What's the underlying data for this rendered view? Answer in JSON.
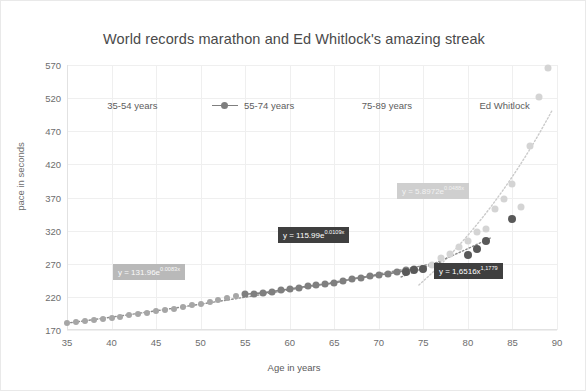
{
  "chart_data": {
    "type": "scatter",
    "title": "World records marathon and Ed Whitlock's amazing streak",
    "xlabel": "Age in years",
    "ylabel": "pace in seconds",
    "xlim": [
      35,
      90
    ],
    "ylim": [
      170,
      570
    ],
    "xticks": [
      35,
      40,
      45,
      50,
      55,
      60,
      65,
      70,
      75,
      80,
      85,
      90
    ],
    "yticks": [
      170,
      220,
      270,
      320,
      370,
      420,
      470,
      520,
      570
    ],
    "grid": true,
    "legend_position": "top-inside",
    "series": [
      {
        "name": "35-54 years",
        "color": "#a6a6a6",
        "marker": "circle",
        "line": false,
        "points": [
          [
            35,
            180
          ],
          [
            36,
            182
          ],
          [
            37,
            183
          ],
          [
            38,
            185
          ],
          [
            39,
            186
          ],
          [
            40,
            188
          ],
          [
            41,
            190
          ],
          [
            42,
            192
          ],
          [
            43,
            194
          ],
          [
            44,
            196
          ],
          [
            45,
            198
          ],
          [
            46,
            200
          ],
          [
            47,
            202
          ],
          [
            48,
            205
          ],
          [
            49,
            207
          ],
          [
            50,
            210
          ],
          [
            51,
            213
          ],
          [
            52,
            216
          ],
          [
            53,
            218
          ],
          [
            54,
            221
          ]
        ]
      },
      {
        "name": "55-74 years",
        "color": "#7f7f7f",
        "marker": "circle",
        "line": true,
        "points": [
          [
            55,
            224
          ],
          [
            56,
            225
          ],
          [
            57,
            226
          ],
          [
            58,
            228
          ],
          [
            59,
            230
          ],
          [
            60,
            232
          ],
          [
            61,
            234
          ],
          [
            62,
            236
          ],
          [
            63,
            238
          ],
          [
            64,
            239
          ],
          [
            65,
            241
          ],
          [
            66,
            244
          ],
          [
            67,
            247
          ],
          [
            68,
            249
          ],
          [
            69,
            251
          ],
          [
            70,
            253
          ],
          [
            71,
            255
          ],
          [
            72,
            257
          ],
          [
            73,
            260
          ],
          [
            74,
            262
          ]
        ]
      },
      {
        "name": "75-89 years",
        "color": "#d4d4d4",
        "marker": "circle",
        "line": false,
        "points": [
          [
            75,
            262
          ],
          [
            76,
            268
          ],
          [
            77,
            278
          ],
          [
            78,
            284
          ],
          [
            79,
            296
          ],
          [
            80,
            305
          ],
          [
            81,
            318
          ],
          [
            82,
            322
          ],
          [
            83,
            352
          ],
          [
            84,
            368
          ],
          [
            85,
            390
          ],
          [
            86,
            355
          ],
          [
            87,
            448
          ],
          [
            88,
            522
          ],
          [
            89,
            565
          ]
        ]
      },
      {
        "name": "Ed Whitlock",
        "color": "#595959",
        "marker": "circle",
        "line": false,
        "points": [
          [
            73,
            258
          ],
          [
            74,
            260
          ],
          [
            75,
            262
          ],
          [
            80,
            283
          ],
          [
            81,
            292
          ],
          [
            82,
            305
          ],
          [
            85,
            338
          ]
        ]
      }
    ],
    "trendlines": [
      {
        "name": "35-54 fit",
        "equation_text": "y = 131.96e",
        "exponent_text": "0.0083x",
        "style": "dotted",
        "label_background": "#b9b9b9",
        "label_color": "#fafafa"
      },
      {
        "name": "55-74 fit",
        "equation_text": "y = 115.99e",
        "exponent_text": "0.0109x",
        "style": "dotted",
        "label_background": "#3f3f3f",
        "label_color": "#ffffff"
      },
      {
        "name": "75-89 fit",
        "equation_text": "y = 5.8972e",
        "exponent_text": "0.0488x",
        "style": "dotted",
        "label_background": "#cfcfcf",
        "label_color": "#f2f2f2"
      },
      {
        "name": "Ed Whitlock fit",
        "equation_text": "y = 1,6516x",
        "exponent_text": "1,1779",
        "style": "dotted",
        "label_background": "#3f3f3f",
        "label_color": "#ffffff"
      }
    ]
  }
}
